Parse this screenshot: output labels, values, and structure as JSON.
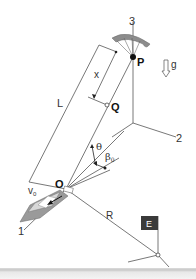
{
  "figure": {
    "axes": {
      "axis1_label": "1",
      "axis2_label": "2",
      "axis3_label": "3"
    },
    "points": {
      "P": "P",
      "Q": "Q",
      "O": "O"
    },
    "labels": {
      "L": "L",
      "x": "x",
      "R": "R",
      "theta": "θ",
      "beta0_base": "β",
      "beta0_sub": "0",
      "v0_base": "v",
      "v0_sub": "0",
      "g": "g",
      "flag": "E"
    },
    "colors": {
      "line": "#555555",
      "boat_hull": "#9a9a9a",
      "boat_light": "#d0d0d0",
      "flag": "#3a3a3a",
      "canopy": "#8c8c8c"
    }
  }
}
